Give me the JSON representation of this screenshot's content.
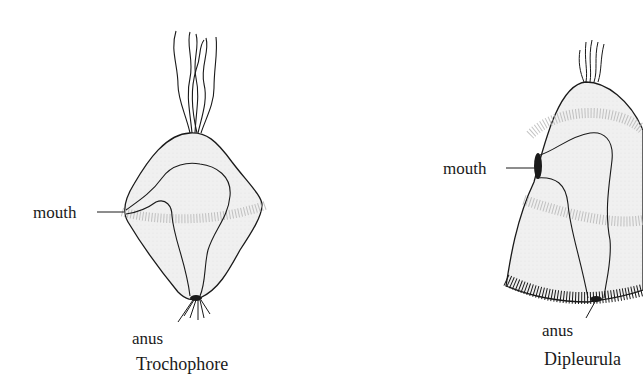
{
  "figure": {
    "panels": [
      {
        "name": "Trochophore",
        "labels": {
          "mouth": "mouth",
          "anus": "anus",
          "caption": "Trochophore"
        }
      },
      {
        "name": "Dipleurula",
        "labels": {
          "mouth": "mouth",
          "anus": "anus",
          "caption": "Dipleurula"
        }
      }
    ],
    "colors": {
      "outline": "#1a1a1a",
      "fill": "#eeeeee",
      "cilia": "#9a9a9a",
      "background": "#ffffff"
    }
  }
}
